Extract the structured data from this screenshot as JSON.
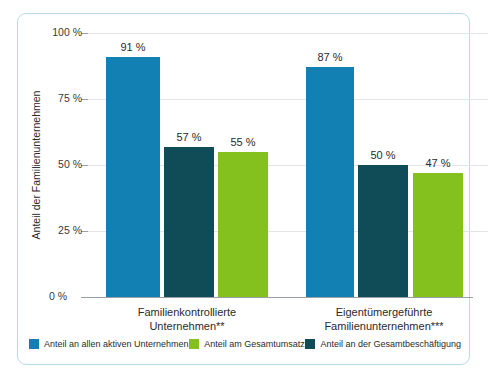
{
  "chart_data": {
    "type": "bar",
    "title": "",
    "xlabel": "",
    "ylabel": "Anteil der Familienunternehmen",
    "ylim": [
      0,
      100
    ],
    "yticks": [
      "0 %",
      "25 %",
      "50 %",
      "75 %",
      "100 %"
    ],
    "ytick_values": [
      0,
      25,
      50,
      75,
      100
    ],
    "grid": true,
    "legend_position": "bottom",
    "value_suffix": " %",
    "categories": [
      "Familienkontrollierte Unternehmen**",
      "Eigentümergeführte Familienunternehmen***"
    ],
    "category_lines": [
      [
        "Familienkontrollierte",
        "Unternehmen**"
      ],
      [
        "Eigentümergeführte",
        "Familienunternehmen***"
      ]
    ],
    "series": [
      {
        "name": "Anteil an allen aktiven Unternehmen",
        "color": "#1380b4",
        "values": [
          91,
          87
        ],
        "labels": [
          "91 %",
          "87 %"
        ]
      },
      {
        "name": "Anteil an der Gesamtbeschäftigung",
        "color": "#0f4c57",
        "values": [
          57,
          50
        ],
        "labels": [
          "57 %",
          "50 %"
        ]
      },
      {
        "name": "Anteil am Gesamtumsatz",
        "color": "#84c01e",
        "values": [
          55,
          47
        ],
        "labels": [
          "55 %",
          "47 %"
        ]
      }
    ],
    "legend_order": [
      "Anteil an allen aktiven Unternehmen",
      "Anteil am Gesamtumsatz",
      "Anteil an der Gesamtbeschäftigung"
    ]
  },
  "legend": {
    "items": [
      {
        "label": "Anteil an allen aktiven Unternehmen",
        "color": "#1380b4"
      },
      {
        "label": "Anteil am Gesamtumsatz",
        "color": "#84c01e"
      },
      {
        "label": "Anteil an der Gesamtbeschäftigung",
        "color": "#0f4c57"
      }
    ]
  },
  "colors": {
    "blue": "#1380b4",
    "green": "#84c01e",
    "teal": "#0f4c57",
    "gridline": "#e4e4e4",
    "axis": "#9aa0a4",
    "frame": "#b8d9e8",
    "text": "#2b2b2b"
  }
}
